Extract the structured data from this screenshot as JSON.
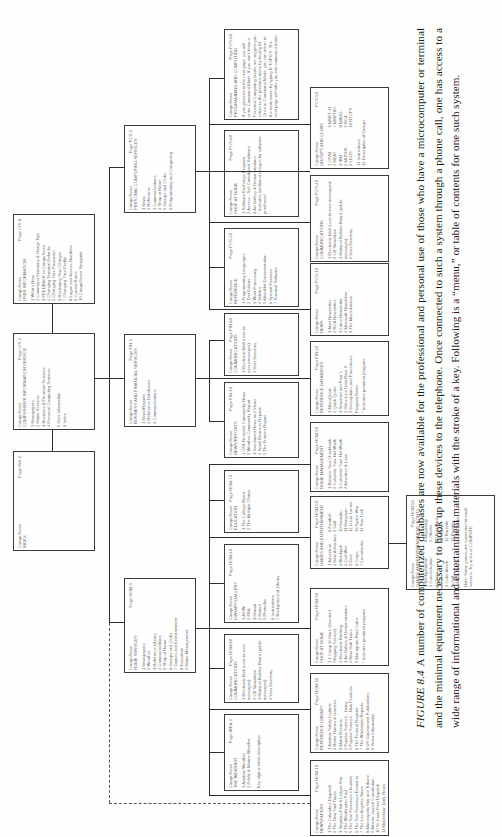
{
  "caption": {
    "figure_label": "FIGURE 8.4",
    "text": "A number of computerized databases are now available for the professional and personal use of those who have a microcomputer or terminal and the minimal equipment necessary to hook up these devices to the telephone. Once connected to such a system through a phone call, one has access to a wide range of informational and entertainment materials with the stroke of a key. Following is a “menu,” or table of contents for one such system."
  },
  "menus": {
    "index": {
      "brand": "CompuServe",
      "page": "Page INX-1",
      "title": "INDEX",
      "items": []
    },
    "cis": {
      "brand": "CompuServe",
      "page": "Page CIS-1",
      "title": "COMPUSERVE INFORMATION SERVICE",
      "items": [
        "1 Newspapers",
        "2 Home Services",
        "3 Business & Financial Services",
        "4 Personal Computing Services",
        "",
        "5 User Information",
        "6 Index"
      ]
    },
    "user_info": {
      "brand": "CompuServe",
      "page": "Page CIS-8",
      "title": "USER INFORMATION",
      "items": [
        "1 What's New",
        "2 Command Summary & Usage Tips",
        "3 FEEDBACK to CompuServe",
        "4 Changing Terminal Defaults",
        "5 Changing Your Password",
        "6 Reviewing Your Charges",
        "7 Changing Your Profile",
        "8 Logon and Access Numbers",
        "9 Current Rates",
        "10 CompuServe Viewpoint"
      ]
    },
    "pcs": {
      "brand": "CompuServe",
      "page": "Page PCS-1",
      "title": "PERSONAL COMPUTING SERVICES",
      "items": [
        "1 News",
        "2 Reference",
        "3 Communications",
        "4 Shop at Home",
        "5 Groups and Clubs",
        "6 Programming and Computing"
      ]
    },
    "pcs_programming": {
      "brand": "CompuServe",
      "page": "Page PCS-60",
      "title": "PROGRAMMING AND COMPUTING",
      "items": [
        "If you proceed to the next page, you will enter Command Mode. If you don't know a Personal Computing Goals, we suggest you return to the previous menu by keying M.",
        "Once in Command Mode, you can return to the main menu by typing R TOPICS. The next page will take you into command mode."
      ]
    },
    "pcs_groups": {
      "brand": "CompuServe",
      "page": "PCS-50",
      "title": "GROUPS AND CLUBS",
      "items": [
        "1 CP/M",
        "2 HEAT",
        "3 IBM",
        "4 MUSUS",
        "5 LDOS",
        "6 MNET-11",
        "7 MNET80",
        "8 MAUG",
        "9 RCA",
        "10 NTCPS",
        "11 Instructions",
        "12 Description of Groups"
      ]
    },
    "pcs_shop": {
      "brand": "CompuServe",
      "page": "Page PCS-80",
      "title": "SHOP AT HOME",
      "items": [
        "1 Software Exchange Program",
        "2 Access - Sell Contributed Software",
        "3 Art Gallery & Demonstrations",
        "* Indicates additional charges for software purchased"
      ]
    },
    "pcs_communications": {
      "brand": "CompuServe",
      "page": "Page PCS-40",
      "title": "COMMUNICATIONS",
      "items": [
        "1 Electronic Mail (user-to-user messages)",
        "2 CB Simulation",
        "3 National Bulletin Board (public messages)",
        "4 User Directory"
      ]
    },
    "pcs_reference": {
      "brand": "CompuServe",
      "page": "Page PCS-20",
      "title": "REFERENCE",
      "items": [
        "1 Programming Languages",
        "2 Text Editors",
        "3 Word Processing",
        "4 Utilities",
        "5 MicroNet Documentation",
        "6 Special Features",
        "7 Terminal Software"
      ]
    },
    "pcs_news": {
      "brand": "CompuServe",
      "page": "Page PCS-10",
      "title": "NEWS",
      "items": [
        "1 Atari Newsletter",
        "2 RCA Newsletter",
        "3 Lotus Newsletter",
        "4 Microsoft Newsletter",
        "5 The Micro Advisor"
      ]
    },
    "fin": {
      "brand": "CompuServe",
      "page": "Page FIN-1",
      "title": "BUSINESS AND FINANCIAL SERVICES",
      "items": [
        "1 News/Reports",
        "2 Reference Databases",
        "3 Communications"
      ]
    },
    "fin_communications": {
      "brand": "CompuServe",
      "page": "Page FIN-80",
      "title": "COMMUNICATIONS",
      "items": [
        "1 Electronic Mail (user-to-user messages)",
        "2 User Directory"
      ]
    },
    "fin_news": {
      "brand": "CompuServe",
      "page": "Page FIN-10",
      "title": "NEWS/REPORTS",
      "items": [
        "1 CPA Financial Commodity News",
        "2 Weather Commodity Report",
        "3 Investment News and Views",
        "4 Small Business Reports",
        "5 The Futures Report"
      ]
    },
    "fin_reference": {
      "brand": "CompuServe",
      "page": "Page FIN-20",
      "title": "REFERENCE DATABASES",
      "items": [
        "1 MicroQuote",
        "2 Quick Quote",
        "3 Standard and Poor's",
        "4 Value Line Data Base II",
        "5 Descriptions and Procedures Program Rates",
        "",
        "* Indicates premium program"
      ]
    },
    "hom": {
      "brand": "CompuServe",
      "page": "Page HOM-1",
      "title": "HOME SERVICES",
      "items": [
        "1 Newspapers",
        "2 Weather",
        "3 Reference Library",
        "4 Communications",
        "5 Shop at Home",
        "6 Groups and Clubs",
        "7 Games and Entertainment",
        "8 Education",
        "9 Home Management"
      ]
    },
    "hom_management": {
      "brand": "CompuServe",
      "page": "Page HOM-90",
      "title": "HOME MANAGEMENT",
      "items": [
        "1 Balance Your Checkbook",
        "2 Calculate Your Net Worth",
        "3 Calculate Your Net Worth",
        "4 Advertise & Loan"
      ]
    },
    "hom_education": {
      "brand": "CompuServe",
      "page": "Page HOM-70",
      "title": "EDUCATION",
      "items": [
        "1 The College Board",
        "2 The Multiple Choice"
      ]
    },
    "hom_games": {
      "brand": "CompuServe",
      "page": "Page HOM-50",
      "title": "GAMES AND ENTERTAINMENT",
      "items": [
        "1 Adventure",
        "2 New Adventure",
        "3 Blackjack",
        "4 Civil War",
        "5 Dice",
        "6 Craps",
        "7 Lunarlander",
        "8 Football",
        "9 Golf",
        "10 Gomoku",
        "11 Hangman",
        "12 Lunar Lander",
        "13 Space War",
        "14 Star Trek"
      ]
    },
    "hom_games_menu": {
      "brand": "CompuServe",
      "page": "Page HOM-51",
      "title": "GAMES AND ENTERTAINMENT (cont.)",
      "items": [
        "1 Backgammon",
        "2 Concentration",
        "3 Chess",
        "4 Fox",
        "5 Cube Attack",
        "6 Golf",
        "7 Maze Runner",
        "8 Mugwump",
        "9 Othello",
        "10 Parachute",
        "11 Poker",
        "12 Roulette",
        "13 Rambler",
        "14 Bird Strike",
        "Note: Some games are connected to small screens. Try and use COMPUTE"
      ]
    },
    "hom_library": {
      "brand": "CompuServe",
      "page": "Page HOM-40",
      "title": "LIBRARY/GALLERY",
      "items": [
        "1 AVIW",
        "2 FRA",
        "3 Hawaii",
        "4 Nature",
        "5 Photo Art",
        "6 Instructions",
        "7 Background of Library"
      ]
    },
    "hom_communications": {
      "brand": "CompuServe",
      "page": "Page HOM-80",
      "title": "COMMUNICATIONS",
      "items": [
        "1 Electronic Mail (user-to-user messages)",
        "2 CB Simulation",
        "3 National Bulletin Board (public messages)",
        "4 User Directory"
      ]
    },
    "hom_shop": {
      "brand": "CompuServe",
      "page": "Page HOM-60",
      "title": "SHOP AT HOME",
      "items": [
        "1 1 Comp-U-Store (Discount Shopping Service)",
        "2 Electronic Banking",
        "3 Art Gallery & Demonstrations",
        "4 New York Times",
        "5 Monogram Rare Coins",
        "",
        "* Indicates premium program"
      ]
    },
    "hom_weather": {
      "brand": "CompuServe",
      "page": "Page WEA-1",
      "title": "THE WEATHER",
      "items": [
        "1 Aviation Weather",
        "2 Public & Marine Weather",
        "",
        "Key digit or letter description"
      ]
    },
    "hom_reference": {
      "brand": "CompuServe",
      "page": "Page HOM-30",
      "title": "REFERENCE LIBRARY",
      "items": [
        "1 Aviation Safety Institute",
        "2 Better Homes & Gardens",
        "3 Motor Records",
        "4 Popular Science - Living",
        "5 Popular Science - New Products",
        "6 The Federal Register",
        "7 The Worldwide Reports",
        "8 US Government Publications",
        "9 Video Information"
      ]
    },
    "hom_newspapers": {
      "brand": "CompuServe",
      "page": "Page HOM-10",
      "title": "NEWSPAPERS",
      "items": [
        "1 The Columbus Dispatch",
        "2 The New York Times",
        "3 Virginian-Pilot & Ledger-Star",
        "4 The Washington Post",
        "5 The San Francisco Chronicle",
        "6 The San Francisco Examiner",
        "7 The Los Angeles Times",
        "8 Minneapolis Star and Tribune",
        "9 Atlanta Journal Constitution",
        "10 St. Louis Post Dispatch",
        "11 Middletown Daily News"
      ]
    }
  }
}
